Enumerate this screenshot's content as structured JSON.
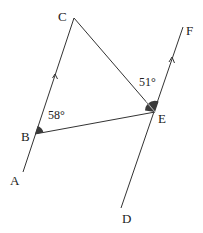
{
  "diagram": {
    "type": "geometry",
    "points": {
      "A": {
        "label": "A"
      },
      "B": {
        "label": "B"
      },
      "C": {
        "label": "C"
      },
      "D": {
        "label": "D"
      },
      "E": {
        "label": "E"
      },
      "F": {
        "label": "F"
      }
    },
    "angles": {
      "angle_B": "58°",
      "angle_E": "51°"
    },
    "colors": {
      "line": "#333333",
      "angle_fill": "#3a3a3a"
    }
  }
}
